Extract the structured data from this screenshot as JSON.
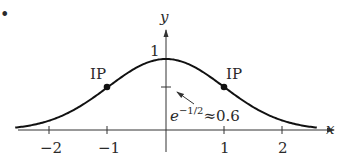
{
  "figure": {
    "bullet": "•",
    "axes": {
      "x_label": "x",
      "y_label": "y",
      "x_ticks": [
        "−2",
        "−1",
        "1",
        "2"
      ],
      "y_tick_label": "1"
    },
    "curve": {
      "function": "y = e^(-x^2/2)",
      "x_range": [
        -2.6,
        2.6
      ]
    },
    "inflection_points": [
      {
        "label": "IP",
        "x": -1,
        "y": 0.6065
      },
      {
        "label": "IP",
        "x": 1,
        "y": 0.6065
      }
    ],
    "annotation": {
      "base": "e",
      "exponent": "−1/2",
      "approx": "≈0.6"
    },
    "colors": {
      "curve": "#111111",
      "axes": "#333333",
      "text": "#2a2a2a"
    }
  },
  "chart_data": {
    "type": "line",
    "title": "",
    "xlabel": "x",
    "ylabel": "y",
    "x": [
      -2.5,
      -2,
      -1.5,
      -1,
      -0.5,
      0,
      0.5,
      1,
      1.5,
      2,
      2.5
    ],
    "series": [
      {
        "name": "e^(-x^2/2)",
        "values": [
          0.044,
          0.135,
          0.325,
          0.607,
          0.882,
          1.0,
          0.882,
          0.607,
          0.325,
          0.135,
          0.044
        ]
      }
    ],
    "x_ticks": [
      -2,
      -1,
      1,
      2
    ],
    "y_ticks": [
      1
    ],
    "xlim": [
      -2.7,
      2.9
    ],
    "ylim": [
      0,
      1.4
    ],
    "grid": false,
    "annotations": [
      {
        "text": "IP",
        "x": -1,
        "y": 0.607
      },
      {
        "text": "IP",
        "x": 1,
        "y": 0.607
      },
      {
        "text": "e^{-1/2}≈0.6",
        "x": 0,
        "y": 0.607
      }
    ]
  }
}
